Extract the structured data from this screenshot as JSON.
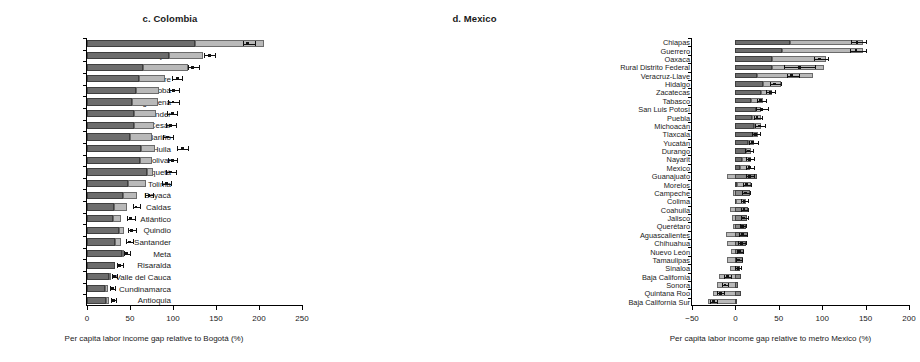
{
  "figure": {
    "panels": [
      {
        "id": "colombia",
        "title": "c. Colombia",
        "xlabel": "Per capita labor income gap relative to Bogotá (%)",
        "xlim": [
          0,
          250
        ],
        "xticks": [
          0,
          50,
          100,
          150,
          200,
          250
        ],
        "xticklabels": [
          "0",
          "50",
          "100",
          "150",
          "200",
          "250"
        ]
      },
      {
        "id": "mexico",
        "title": "d. Mexico",
        "xlabel": "Per capita labor income gap relative to metro Mexico (%)",
        "xlim": [
          -50,
          200
        ],
        "xticks": [
          -50,
          0,
          50,
          100,
          150,
          200
        ],
        "xticklabels": [
          "−50",
          "0",
          "50",
          "100",
          "150",
          "200"
        ]
      }
    ]
  },
  "chart_data": [
    {
      "type": "bar",
      "orientation": "horizontal",
      "stacked": true,
      "title": "c. Colombia",
      "xlabel": "Per capita labor income gap relative to Bogotá (%)",
      "ylabel": "",
      "xlim": [
        0,
        250
      ],
      "ylim": [],
      "grid": false,
      "legend": "none",
      "series": [
        {
          "name": "lower segment",
          "color": "#6d6d6d"
        },
        {
          "name": "upper segment",
          "color": "#b9b9b9"
        }
      ],
      "categories": [
        "Chocó",
        "La Guajira",
        "Cauca",
        "Sucre",
        "Córdoba",
        "Magdalena",
        "Norte de Santander",
        "Cesar",
        "Nariño",
        "Huila",
        "Bolivar",
        "Caquetá",
        "Tolima",
        "Boyacá",
        "Caldas",
        "Atlántico",
        "Quindio",
        "Santander",
        "Meta",
        "Risaralda",
        "Valle del Cauca",
        "Cundinamarca",
        "Antioquia"
      ],
      "segment_dark": [
        125,
        95,
        65,
        60,
        57,
        52,
        55,
        55,
        50,
        63,
        62,
        70,
        48,
        42,
        31,
        30,
        37,
        33,
        41,
        33,
        25,
        21,
        22
      ],
      "segment_light": [
        81,
        40,
        52,
        31,
        27,
        30,
        25,
        23,
        25,
        16,
        14,
        7,
        21,
        16,
        16,
        10,
        6,
        6,
        1,
        0,
        3,
        4,
        4
      ],
      "total": [
        206,
        135,
        117,
        91,
        84,
        82,
        80,
        78,
        75,
        79,
        76,
        77,
        69,
        58,
        47,
        40,
        43,
        39,
        42,
        33,
        28,
        25,
        26
      ],
      "estimate": [
        187,
        142,
        123,
        105,
        101,
        100,
        99,
        97,
        94,
        111,
        99,
        97,
        92,
        72,
        57,
        51,
        52,
        49,
        46,
        38,
        32,
        30,
        31
      ],
      "ci_low": [
        181,
        136,
        117,
        99,
        95,
        94,
        93,
        92,
        88,
        105,
        94,
        92,
        87,
        68,
        53,
        47,
        48,
        45,
        43,
        35,
        29,
        27,
        28
      ],
      "ci_high": [
        195,
        149,
        130,
        111,
        107,
        107,
        105,
        103,
        100,
        117,
        105,
        103,
        98,
        77,
        62,
        56,
        57,
        54,
        50,
        42,
        35,
        33,
        34
      ]
    },
    {
      "type": "bar",
      "orientation": "horizontal",
      "stacked": true,
      "title": "d. Mexico",
      "xlabel": "Per capita labor income gap relative to metro Mexico (%)",
      "ylabel": "",
      "xlim": [
        -50,
        200
      ],
      "grid": false,
      "legend": "none",
      "series": [
        {
          "name": "lower segment",
          "color": "#6d6d6d"
        },
        {
          "name": "upper segment",
          "color": "#b9b9b9"
        }
      ],
      "categories": [
        "Chiapas",
        "Guerrero",
        "Oaxaca",
        "Rural Distrito Federal",
        "Veracruz-Llave",
        "Hidalgo",
        "Zacatecas",
        "Tabasco",
        "San Luis Potosí",
        "Puebla",
        "Michoacán",
        "Tlaxcala",
        "Yucatán",
        "Durango",
        "Nayarit",
        "Mexico",
        "Guanajuato",
        "Morelos",
        "Campeche",
        "Colima",
        "Coahuila",
        "Jalisco",
        "Querétaro",
        "Aguascalientes",
        "Chihuahua",
        "Nuevo León",
        "Tamaulipas",
        "Sinaloa",
        "Baja California",
        "Sonora",
        "Quintana Roo",
        "Baja California Sur"
      ],
      "segment_dark": [
        63,
        54,
        42,
        42,
        25,
        32,
        30,
        18,
        24,
        19,
        22,
        20,
        14,
        12,
        8,
        5,
        -10,
        2,
        -3,
        1,
        -6,
        -4,
        -3,
        -11,
        -10,
        -5,
        -10,
        -6,
        -19,
        -21,
        -26,
        -32
      ],
      "segment_light": [
        84,
        93,
        62,
        60,
        65,
        21,
        12,
        14,
        5,
        10,
        7,
        6,
        8,
        6,
        10,
        12,
        35,
        16,
        20,
        11,
        20,
        17,
        15,
        26,
        22,
        15,
        19,
        11,
        26,
        24,
        32,
        34
      ],
      "total": [
        147,
        147,
        104,
        102,
        90,
        53,
        42,
        32,
        29,
        29,
        29,
        26,
        22,
        18,
        18,
        17,
        25,
        18,
        17,
        12,
        14,
        13,
        12,
        15,
        12,
        10,
        9,
        5,
        7,
        3,
        6,
        2
      ],
      "estimate": [
        140,
        139,
        97,
        74,
        65,
        45,
        40,
        29,
        30,
        25,
        28,
        23,
        20,
        15,
        16,
        16,
        16,
        13,
        12,
        10,
        10,
        9,
        8,
        8,
        7,
        5,
        4,
        3,
        -9,
        -12,
        -17,
        -25
      ],
      "ci_low": [
        133,
        132,
        90,
        56,
        59,
        40,
        35,
        25,
        24,
        21,
        23,
        19,
        16,
        11,
        12,
        12,
        12,
        9,
        8,
        7,
        6,
        6,
        5,
        4,
        3,
        2,
        1,
        0,
        -13,
        -16,
        -21,
        -29
      ],
      "ci_high": [
        150,
        151,
        107,
        92,
        73,
        52,
        46,
        35,
        38,
        31,
        34,
        28,
        26,
        20,
        21,
        21,
        21,
        18,
        17,
        14,
        15,
        14,
        12,
        13,
        12,
        9,
        8,
        7,
        -5,
        -8,
        -13,
        -21
      ]
    }
  ]
}
